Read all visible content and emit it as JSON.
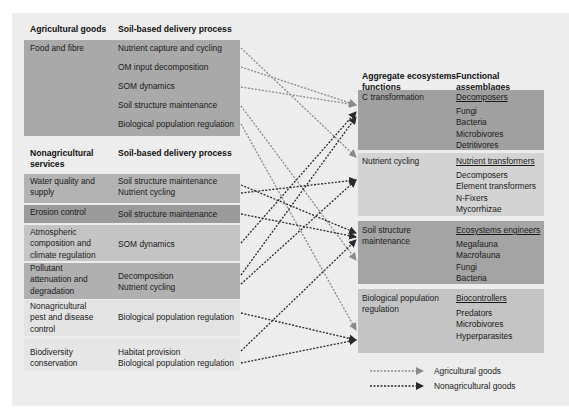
{
  "left_agri": {
    "header_goods": "Agricultural goods",
    "header_process": "Soil-based delivery process",
    "good": "Food and fibre",
    "processes": [
      "Nutrient capture and cycling",
      "OM input decomposition",
      "SOM dynamics",
      "Soil structure maintenance",
      "Biological population regulation"
    ]
  },
  "left_nonagri": {
    "header_services_1": "Nonagricultural",
    "header_services_2": "services",
    "header_process": "Soil-based delivery process",
    "rows": [
      {
        "service": [
          "Water quality and",
          "supply"
        ],
        "process": [
          "Soil structure maintenance",
          "Nutrient cycling"
        ]
      },
      {
        "service": [
          "Erosion control"
        ],
        "process": [
          "Soil structure maintenance"
        ]
      },
      {
        "service": [
          "Atmospheric",
          "composition and",
          "climate regulation"
        ],
        "process": [
          "SOM dynamics"
        ]
      },
      {
        "service": [
          "Pollutant",
          "attenuation and",
          "degradation"
        ],
        "process": [
          "Decomposition",
          "Nutrient cycling"
        ]
      },
      {
        "service": [
          "Nonagricultural",
          "pest and disease",
          "control"
        ],
        "process": [
          "Biological population regulation"
        ]
      },
      {
        "service": [
          "Biodiversity",
          "conservation"
        ],
        "process": [
          "Habitat provision",
          "Biological population regulation"
        ]
      }
    ]
  },
  "right": {
    "header_functions_1": "Aggregate ecosystems",
    "header_functions_2": "functions",
    "header_assemblages_1": "Functional",
    "header_assemblages_2": "assemblages",
    "rows": [
      {
        "function": [
          "C transformation"
        ],
        "assemblage": "Decomposers",
        "members": [
          "Fungi",
          "Bacteria",
          "Microbivores",
          "Detritivores"
        ]
      },
      {
        "function": [
          "Nutrient cycling"
        ],
        "assemblage": "Nutrient transformers",
        "members": [
          "Decomposers",
          "Element transformers",
          "N-Fixers",
          "Mycorrhizae"
        ]
      },
      {
        "function": [
          "Soil structure",
          "maintenance"
        ],
        "assemblage": "Ecosystems engineers",
        "members": [
          "Megafauna",
          "Macrofauna",
          "Fungi",
          "Bacteria"
        ]
      },
      {
        "function": [
          "Biological population",
          "regulation"
        ],
        "assemblage": "Biocontrollers",
        "members": [
          "Predators",
          "Microbivores",
          "Hyperparasites"
        ]
      }
    ]
  },
  "legend": {
    "agricultural": "Agricultural goods",
    "nonagricultural": "Nonagricultural goods"
  },
  "colors": {
    "panel": "#ededed",
    "agri_arrow": "#8a8a8a",
    "nonagri_arrow": "#2a2a2a",
    "dark_box": "#a3a3a3",
    "mid_box": "#b5b5b5",
    "light_box": "#c6c6c6",
    "pale_box": "#e4e4e4"
  }
}
